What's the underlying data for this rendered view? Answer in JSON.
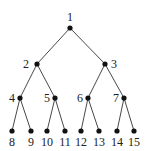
{
  "diagram": {
    "type": "binary-tree",
    "colors": {
      "edge": "#333333",
      "node": "#111111",
      "label": "#222222",
      "background": "#ffffff"
    },
    "nodes": [
      {
        "id": 1,
        "label": "1",
        "x": 70,
        "y": 28,
        "lx": 70,
        "ly": 21,
        "anchor": "middle"
      },
      {
        "id": 2,
        "label": "2",
        "x": 37,
        "y": 64,
        "lx": 29,
        "ly": 68,
        "anchor": "end"
      },
      {
        "id": 3,
        "label": "3",
        "x": 105,
        "y": 64,
        "lx": 111,
        "ly": 68,
        "anchor": "start"
      },
      {
        "id": 4,
        "label": "4",
        "x": 20,
        "y": 98,
        "lx": 15,
        "ly": 102,
        "anchor": "end"
      },
      {
        "id": 5,
        "label": "5",
        "x": 55,
        "y": 98,
        "lx": 50,
        "ly": 102,
        "anchor": "end"
      },
      {
        "id": 6,
        "label": "6",
        "x": 88,
        "y": 98,
        "lx": 83,
        "ly": 102,
        "anchor": "end"
      },
      {
        "id": 7,
        "label": "7",
        "x": 124,
        "y": 98,
        "lx": 119,
        "ly": 102,
        "anchor": "end"
      },
      {
        "id": 8,
        "label": "8",
        "x": 12,
        "y": 131,
        "lx": 12,
        "ly": 146,
        "anchor": "middle"
      },
      {
        "id": 9,
        "label": "9",
        "x": 31,
        "y": 131,
        "lx": 31,
        "ly": 146,
        "anchor": "middle"
      },
      {
        "id": 10,
        "label": "10",
        "x": 47,
        "y": 131,
        "lx": 47,
        "ly": 146,
        "anchor": "middle"
      },
      {
        "id": 11,
        "label": "11",
        "x": 65,
        "y": 131,
        "lx": 65,
        "ly": 146,
        "anchor": "middle"
      },
      {
        "id": 12,
        "label": "12",
        "x": 81,
        "y": 131,
        "lx": 81,
        "ly": 146,
        "anchor": "middle"
      },
      {
        "id": 13,
        "label": "13",
        "x": 99,
        "y": 131,
        "lx": 99,
        "ly": 146,
        "anchor": "middle"
      },
      {
        "id": 14,
        "label": "14",
        "x": 117,
        "y": 131,
        "lx": 117,
        "ly": 146,
        "anchor": "middle"
      },
      {
        "id": 15,
        "label": "15",
        "x": 134,
        "y": 131,
        "lx": 134,
        "ly": 146,
        "anchor": "middle"
      }
    ],
    "edges": [
      [
        1,
        2
      ],
      [
        1,
        3
      ],
      [
        2,
        4
      ],
      [
        2,
        5
      ],
      [
        3,
        6
      ],
      [
        3,
        7
      ],
      [
        4,
        8
      ],
      [
        4,
        9
      ],
      [
        5,
        10
      ],
      [
        5,
        11
      ],
      [
        6,
        12
      ],
      [
        6,
        13
      ],
      [
        7,
        14
      ],
      [
        7,
        15
      ]
    ]
  }
}
